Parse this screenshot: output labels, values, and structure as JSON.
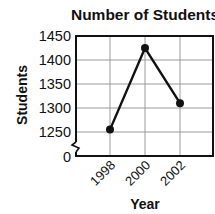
{
  "chart_data": {
    "type": "line",
    "title": "Number of Students",
    "xlabel": "Year",
    "ylabel": "Students",
    "categories": [
      "1998",
      "2000",
      "2002"
    ],
    "series": [
      {
        "name": "Students",
        "values": [
          1255,
          1425,
          1310
        ]
      }
    ],
    "y_ticks": [
      "0",
      "1250",
      "1300",
      "1350",
      "1400",
      "1450"
    ],
    "ylim": [
      1250,
      1450
    ],
    "axis_break": true,
    "grid": true,
    "legend": "none",
    "colors": {
      "line": "#111111",
      "grid": "#9a9a9a",
      "frame": "#111111"
    }
  }
}
